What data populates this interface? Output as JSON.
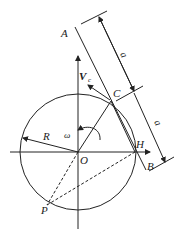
{
  "diagram": {
    "type": "physics-geometry",
    "labels": {
      "A": "A",
      "B": "B",
      "C": "C",
      "H": "H",
      "O": "O",
      "P": "P",
      "R": "R",
      "omega": "ω",
      "V": "V",
      "V_sub": "c",
      "dim_top": "a",
      "dim_bottom": "a"
    },
    "colors": {
      "stroke": "#222222",
      "background": "#ffffff"
    }
  }
}
